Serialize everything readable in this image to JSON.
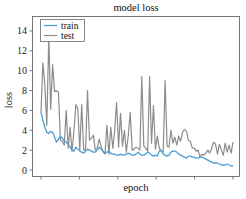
{
  "chart_data": {
    "type": "line",
    "title": "model loss",
    "xlabel": "epoch",
    "ylabel": "loss",
    "ylim": [
      -0.5,
      15.5
    ],
    "yticks": [
      0,
      2,
      4,
      6,
      8,
      10,
      12,
      14
    ],
    "xticks_count": 6,
    "xtick_labels_visible": false,
    "grid": false,
    "legend": {
      "position": "upper left",
      "entries": [
        "train",
        "test"
      ]
    },
    "colors": {
      "train": "#4a9fd8",
      "test": "#8c8c8c"
    },
    "series": [
      {
        "name": "train",
        "x": [
          0,
          1,
          2,
          3,
          4,
          5,
          6,
          7,
          8,
          9,
          10,
          11,
          12,
          13,
          14,
          15,
          16,
          17,
          18,
          19,
          20,
          21,
          22,
          23,
          24,
          25,
          26,
          27,
          28,
          29,
          30,
          31,
          32,
          33,
          34,
          35,
          36,
          37,
          38,
          39,
          40,
          41,
          42,
          43,
          44,
          45,
          46,
          47,
          48,
          49,
          50,
          51,
          52,
          53,
          54,
          55,
          56,
          57,
          58,
          59,
          60,
          61,
          62,
          63,
          64,
          65,
          66,
          67,
          68,
          69,
          70,
          71,
          72,
          73,
          74,
          75,
          76,
          77,
          78,
          79,
          80,
          81,
          82,
          83,
          84,
          85,
          86,
          87,
          88,
          89,
          90,
          91,
          92,
          93,
          94,
          95,
          96,
          97,
          98,
          99
        ],
        "values": [
          5.8,
          5.0,
          4.3,
          3.8,
          3.7,
          3.9,
          3.8,
          3.3,
          2.8,
          3.1,
          3.4,
          3.2,
          2.9,
          2.8,
          2.6,
          2.3,
          2.0,
          1.9,
          2.3,
          2.1,
          1.9,
          1.8,
          1.7,
          1.9,
          2.1,
          2.0,
          1.9,
          1.8,
          1.8,
          2.0,
          2.3,
          2.1,
          1.9,
          1.7,
          1.8,
          1.9,
          1.7,
          1.6,
          1.6,
          1.5,
          1.5,
          1.6,
          1.5,
          1.5,
          1.6,
          1.7,
          1.6,
          1.5,
          1.5,
          1.6,
          1.8,
          1.6,
          1.5,
          1.5,
          1.6,
          1.8,
          1.7,
          1.5,
          1.4,
          1.5,
          1.4,
          1.9,
          2.0,
          1.6,
          1.5,
          1.4,
          1.5,
          1.8,
          1.9,
          1.9,
          1.8,
          1.6,
          1.5,
          1.4,
          1.3,
          1.2,
          1.4,
          1.4,
          1.3,
          1.3,
          1.2,
          1.2,
          1.3,
          1.3,
          1.2,
          1.1,
          1.0,
          0.9,
          0.8,
          0.7,
          0.7,
          0.7,
          0.6,
          0.5,
          0.5,
          0.5,
          0.6,
          0.5,
          0.4,
          0.4
        ]
      },
      {
        "name": "test",
        "x": [
          0,
          1,
          2,
          3,
          4,
          5,
          6,
          7,
          8,
          9,
          10,
          11,
          12,
          13,
          14,
          15,
          16,
          17,
          18,
          19,
          20,
          21,
          22,
          23,
          24,
          25,
          26,
          27,
          28,
          29,
          30,
          31,
          32,
          33,
          34,
          35,
          36,
          37,
          38,
          39,
          40,
          41,
          42,
          43,
          44,
          45,
          46,
          47,
          48,
          49,
          50,
          51,
          52,
          53,
          54,
          55,
          56,
          57,
          58,
          59,
          60,
          61,
          62,
          63,
          64,
          65,
          66,
          67,
          68,
          69,
          70,
          71,
          72,
          73,
          74,
          75,
          76,
          77,
          78,
          79,
          80,
          81,
          82,
          83,
          84,
          85,
          86,
          87,
          88,
          89,
          90,
          91,
          92,
          93,
          94,
          95,
          96,
          97,
          98,
          99
        ],
        "values": [
          5.8,
          10.8,
          8.5,
          4.5,
          13.4,
          6.1,
          10.6,
          7.9,
          8.0,
          7.8,
          3.0,
          2.9,
          2.5,
          6.0,
          2.2,
          4.3,
          1.9,
          4.0,
          6.6,
          6.2,
          2.0,
          6.6,
          2.0,
          2.0,
          8.0,
          3.0,
          3.2,
          3.5,
          2.0,
          2.2,
          3.1,
          2.4,
          1.8,
          1.6,
          4.5,
          1.6,
          4.3,
          2.2,
          4.0,
          6.8,
          2.3,
          5.7,
          2.4,
          4.0,
          1.8,
          3.5,
          5.8,
          2.0,
          2.1,
          2.3,
          2.2,
          2.0,
          9.4,
          2.4,
          2.2,
          1.9,
          9.4,
          2.7,
          6.5,
          2.1,
          3.4,
          2.2,
          1.9,
          1.8,
          9.0,
          2.4,
          2.3,
          4.0,
          2.7,
          3.3,
          2.5,
          3.4,
          2.9,
          3.8,
          4.1,
          3.9,
          3.0,
          2.9,
          2.2,
          2.2,
          1.9,
          2.0,
          1.3,
          1.6,
          1.5,
          1.7,
          2.0,
          1.7,
          2.2,
          2.8,
          2.6,
          1.6,
          2.6,
          2.0,
          1.5,
          2.7,
          1.8,
          2.5,
          1.7,
          2.8
        ]
      }
    ]
  }
}
